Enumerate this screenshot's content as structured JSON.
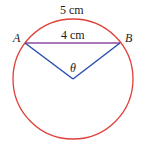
{
  "diagram": {
    "labels": {
      "arc": "5 cm",
      "chord": "4 cm",
      "point_a": "A",
      "point_b": "B",
      "angle": "θ"
    },
    "colors": {
      "circle": "#e0403a",
      "radius": "#2b4fae",
      "chord": "#8a4ca0"
    }
  }
}
